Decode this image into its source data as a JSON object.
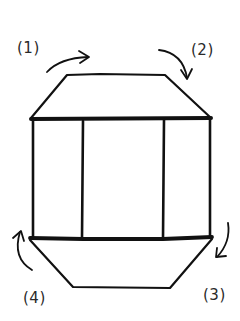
{
  "diagram": {
    "step_labels": [
      {
        "id": 1,
        "text": "(1)"
      },
      {
        "id": 2,
        "text": "(2)"
      },
      {
        "id": 3,
        "text": "(3)"
      },
      {
        "id": 4,
        "text": "(4)"
      }
    ],
    "shapes": {
      "top_trapezoid": "top-face",
      "center_rectangle": "middle-band",
      "center_panels": 3,
      "bottom_trapezoid": "bottom-face"
    },
    "arrows": [
      {
        "step": 1,
        "direction": "curved-right"
      },
      {
        "step": 2,
        "direction": "curved-down"
      },
      {
        "step": 3,
        "direction": "curved-down"
      },
      {
        "step": 4,
        "direction": "curved-up"
      }
    ],
    "colors": {
      "ink": "#111111",
      "background": "#ffffff"
    }
  }
}
